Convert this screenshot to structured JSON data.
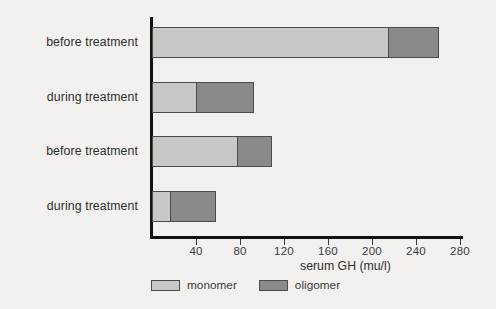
{
  "chart_data": {
    "type": "bar",
    "orientation": "horizontal",
    "stacked": true,
    "title": "",
    "xlabel": "serum GH (mu/l)",
    "ylabel": "",
    "xlim": [
      0,
      280
    ],
    "xticks": [
      40,
      80,
      120,
      160,
      200,
      240,
      280
    ],
    "xtick_labels": [
      "40",
      "80",
      "120",
      "160",
      "200",
      "240",
      "280"
    ],
    "grid": false,
    "legend_position": "bottom-left",
    "categories": [
      "before treatment",
      "during treatment",
      "before treatment",
      "during treatment"
    ],
    "series": [
      {
        "name": "monomer",
        "color": "#c9c8c6",
        "values": [
          215,
          41,
          78,
          17
        ]
      },
      {
        "name": "oligomer",
        "color": "#8a8a8a",
        "values": [
          47,
          53,
          32,
          42
        ]
      }
    ],
    "totals": [
      262,
      94,
      110,
      59
    ]
  },
  "legend": {
    "items": [
      {
        "label": "monomer",
        "color": "#c9c8c6"
      },
      {
        "label": "oligomer",
        "color": "#8a8a8a"
      }
    ]
  },
  "axis": {
    "x_title": "serum GH (mu/l)"
  }
}
